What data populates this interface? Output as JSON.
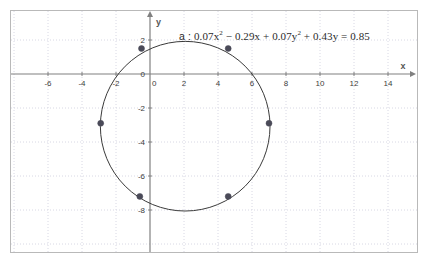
{
  "app": {
    "title": "Graphing calculator circle plot"
  },
  "equation": {
    "name": "a",
    "separator": " : ",
    "text": "a : 0.07x² − 0.29x + 0.07y² + 0.43y = 0.85",
    "parts": {
      "t1": "0.07x",
      "e1": "2",
      "t2": " − 0.29x + 0.07y",
      "e2": "2",
      "t3": " + 0.43y = 0.85"
    },
    "color": "#2b2b2b"
  },
  "axes": {
    "x_label": "x",
    "y_label": "y",
    "axis_color": "#808080",
    "grid_color": "#d8d8e4",
    "x_ticks": [
      -6,
      -4,
      -2,
      0,
      2,
      4,
      6,
      8,
      10,
      12,
      14
    ],
    "y_ticks": [
      2,
      0,
      -2,
      -4,
      -6,
      -8
    ],
    "x_tick_labels": [
      "-6",
      "-4",
      "-2",
      "0",
      "0",
      "2",
      "4",
      "6",
      "8",
      "10",
      "12",
      "14"
    ],
    "y_tick_labels": [
      "2",
      "0",
      "-2",
      "-4",
      "-6",
      "-8"
    ],
    "origin_zero_label_left": "0",
    "origin_zero_label_below": "0"
  },
  "chart_data": {
    "type": "scatter",
    "xlabel": "x",
    "ylabel": "y",
    "xlim": [
      -7.5,
      15.5
    ],
    "ylim": [
      -9.2,
      3.2
    ],
    "grid": true,
    "legend": "none",
    "curve": {
      "name": "a",
      "shape": "circle",
      "equation": "0.07x^2 - 0.29x + 0.07y^2 + 0.43y = 0.85",
      "center": [
        2.07,
        -3.07
      ],
      "radius": 4.99,
      "color": "#3a3a3a",
      "linewidth": 1
    },
    "points": [
      {
        "label": "A",
        "x": -0.5,
        "y": 1.5
      },
      {
        "label": "B",
        "x": 4.6,
        "y": 1.5
      },
      {
        "label": "C",
        "x": 7.0,
        "y": -2.9
      },
      {
        "label": "D",
        "x": 4.6,
        "y": -7.2
      },
      {
        "label": "E",
        "x": -0.6,
        "y": -7.2
      },
      {
        "label": "F",
        "x": -2.9,
        "y": -2.9
      }
    ],
    "point_color": "#4a4a58",
    "point_size": 3
  }
}
